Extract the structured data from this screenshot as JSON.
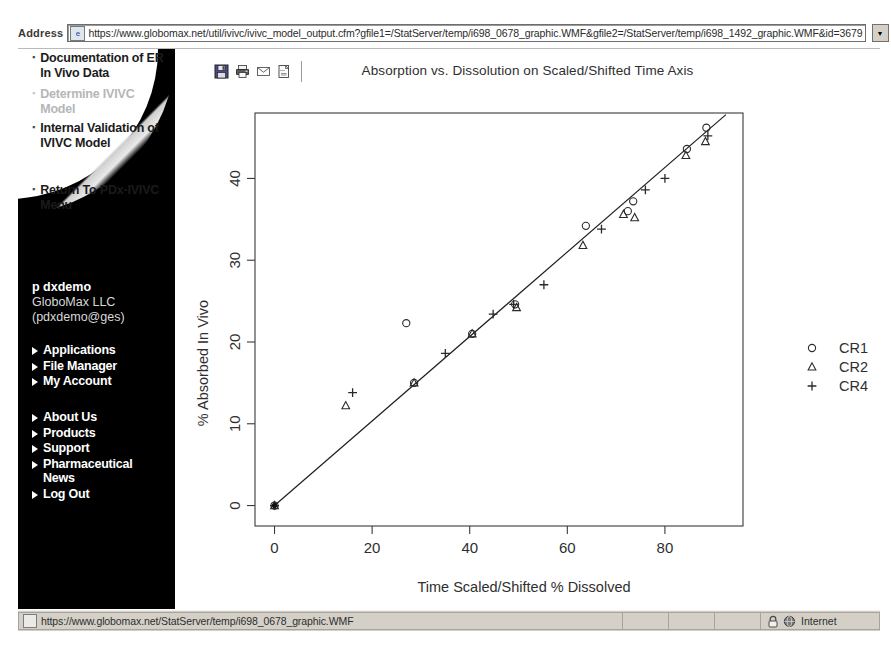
{
  "browser": {
    "address_label": "Address",
    "url": "https://www.globomax.net/util/ivivc/ivivc_model_output.cfm?gfile1=/StatServer/temp/i698_0678_graphic.WMF&gfile2=/StatServer/temp/i698_1492_graphic.WMF&id=3679",
    "go_label": "Go",
    "dropdown_icon": "chevron-down-icon",
    "ie_icon": "page-icon"
  },
  "sidebar": {
    "top_items": [
      {
        "label": "Documentation of ER In Vivo Data",
        "state": "clipped"
      },
      {
        "label": "Determine IVIVC Model",
        "state": "faded"
      },
      {
        "label": "Internal Validation of IVIVC Model",
        "state": "active"
      },
      {
        "label": "Return To PDx-IVIVC Menu",
        "state": "active"
      }
    ],
    "user": {
      "name": "p dxdemo",
      "org": "GloboMax LLC",
      "email": "(pdxdemo@ges)"
    },
    "account_items": [
      "Applications",
      "File Manager",
      "My Account"
    ],
    "site_items": [
      "About Us",
      "Products",
      "Support",
      "Pharmaceutical News",
      "Log Out"
    ]
  },
  "toolbar": {
    "buttons": [
      {
        "name": "save-icon",
        "title": "Save"
      },
      {
        "name": "print-icon",
        "title": "Print"
      },
      {
        "name": "mail-icon",
        "title": "Mail"
      },
      {
        "name": "open-icon",
        "title": "Open"
      }
    ]
  },
  "status": {
    "url": "https://www.globomax.net/StatServer/temp/i698_0678_graphic.WMF",
    "zone": "Internet",
    "lock_icon": "lock-icon",
    "globe_icon": "globe-icon",
    "doc_icon": "document-icon"
  },
  "chart_data": {
    "type": "scatter",
    "title": "Absorption vs. Dissolution on Scaled/Shifted Time Axis",
    "xlabel": "Time Scaled/Shifted % Dissolved",
    "ylabel": "% Absorbed In Vivo",
    "xlim": [
      -4,
      96
    ],
    "ylim": [
      -2.5,
      48
    ],
    "xticks": [
      0,
      20,
      40,
      60,
      80
    ],
    "yticks": [
      0,
      10,
      20,
      30,
      40
    ],
    "grid": false,
    "legend_position": "right",
    "series": [
      {
        "name": "CR1",
        "marker": "circle",
        "points": [
          [
            0.0,
            0.0
          ],
          [
            27.0,
            22.3
          ],
          [
            28.6,
            15.0
          ],
          [
            40.5,
            21.0
          ],
          [
            49.3,
            24.6
          ],
          [
            63.8,
            34.2
          ],
          [
            72.4,
            36.0
          ],
          [
            73.5,
            37.2
          ],
          [
            84.5,
            43.6
          ],
          [
            88.5,
            46.2
          ]
        ]
      },
      {
        "name": "CR2",
        "marker": "triangle",
        "points": [
          [
            0.0,
            0.0
          ],
          [
            14.6,
            12.2
          ],
          [
            28.6,
            15.0
          ],
          [
            40.5,
            21.0
          ],
          [
            49.6,
            24.2
          ],
          [
            63.2,
            31.8
          ],
          [
            71.5,
            35.6
          ],
          [
            73.8,
            35.2
          ],
          [
            84.3,
            42.8
          ],
          [
            88.3,
            44.5
          ]
        ]
      },
      {
        "name": "CR4",
        "marker": "plus",
        "points": [
          [
            0.0,
            0.0
          ],
          [
            16.0,
            13.8
          ],
          [
            35.0,
            18.6
          ],
          [
            44.8,
            23.4
          ],
          [
            49.0,
            24.6
          ],
          [
            55.2,
            27.0
          ],
          [
            67.0,
            33.8
          ],
          [
            76.0,
            38.6
          ],
          [
            80.0,
            40.0
          ],
          [
            88.8,
            45.2
          ]
        ]
      }
    ],
    "fit_line": {
      "x": [
        0,
        92.5
      ],
      "y": [
        0,
        47.8
      ],
      "style": "solid"
    },
    "legend": [
      {
        "label": "CR1",
        "marker": "circle"
      },
      {
        "label": "CR2",
        "marker": "triangle"
      },
      {
        "label": "CR4",
        "marker": "plus"
      }
    ]
  }
}
